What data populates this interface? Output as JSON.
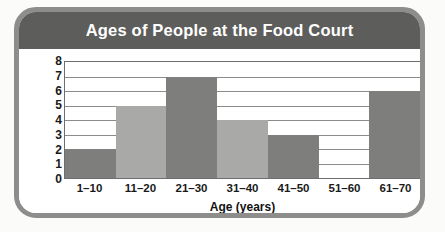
{
  "frame": {
    "border_color": "#8d8d8b",
    "page_background": "#fbfbf9"
  },
  "header": {
    "title": "Ages of People at the Food Court",
    "background_color": "#5d5d5b",
    "text_color": "#ffffff"
  },
  "chart_data": {
    "type": "bar",
    "title": "Ages of People at the Food Court",
    "xlabel": "Age (years)",
    "ylabel": "Number of People",
    "categories": [
      "1–10",
      "11–20",
      "21–30",
      "31–40",
      "41–50",
      "51–60",
      "61–70"
    ],
    "values": [
      2,
      5,
      7,
      4,
      3,
      0,
      6
    ],
    "bar_colors": [
      "#7e7e7c",
      "#a9a9a7",
      "#7e7e7c",
      "#a9a9a7",
      "#7e7e7c",
      "#a9a9a7",
      "#7e7e7c"
    ],
    "ylim": [
      0,
      8
    ],
    "ytick_labels": [
      "8",
      "7",
      "6",
      "5",
      "4",
      "3",
      "2",
      "1",
      "0"
    ],
    "ytick_values": [
      8,
      7,
      6,
      5,
      4,
      3,
      2,
      1,
      0
    ],
    "grid": true,
    "grid_color": "#8c8c8a",
    "legend": null,
    "bar_gap": 0
  }
}
